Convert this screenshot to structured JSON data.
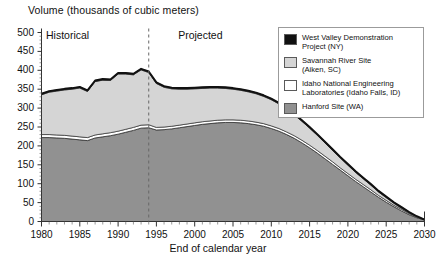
{
  "chart_data": {
    "type": "area",
    "stacked": true,
    "title": "Volume (thousands of cubic meters)",
    "xlabel": "End of calendar year",
    "ylabel": "Volume (thousands of cubic meters)",
    "xlim": [
      1980,
      2030
    ],
    "ylim": [
      0,
      500
    ],
    "yticks": [
      0,
      50,
      100,
      150,
      200,
      250,
      300,
      350,
      400,
      450,
      500
    ],
    "xticks": [
      1980,
      1985,
      1990,
      1995,
      2000,
      2005,
      2010,
      2015,
      2020,
      2025,
      2030
    ],
    "minor_xtick_interval": 1,
    "grid": false,
    "legend_position": "top-right",
    "annotations": [
      {
        "text": "Historical",
        "x": 1984.5,
        "y": 490
      },
      {
        "text": "Projected",
        "x": 2001.5,
        "y": 490
      },
      {
        "text": "divider",
        "type": "vline",
        "x": 1994,
        "style": "dashed"
      }
    ],
    "x": [
      1980,
      1981,
      1982,
      1983,
      1984,
      1985,
      1986,
      1987,
      1988,
      1989,
      1990,
      1991,
      1992,
      1993,
      1994,
      1995,
      1996,
      1997,
      1998,
      1999,
      2000,
      2001,
      2002,
      2003,
      2004,
      2005,
      2006,
      2007,
      2008,
      2009,
      2010,
      2011,
      2012,
      2013,
      2014,
      2015,
      2016,
      2017,
      2018,
      2019,
      2020,
      2021,
      2022,
      2023,
      2024,
      2025,
      2026,
      2027,
      2028,
      2029,
      2030
    ],
    "series": [
      {
        "name": "Hanford Site (WA)",
        "color": "#919191",
        "values": [
          222,
          222,
          221,
          220,
          218,
          216,
          214,
          221,
          224,
          227,
          231,
          236,
          241,
          247,
          248,
          242,
          243,
          245,
          248,
          251,
          254,
          257,
          259,
          261,
          262,
          262,
          261,
          259,
          256,
          252,
          246,
          239,
          230,
          220,
          208,
          195,
          181,
          166,
          151,
          136,
          121,
          106,
          92,
          78,
          64,
          51,
          39,
          28,
          18,
          10,
          4
        ]
      },
      {
        "name": "Idaho National Engineering Laboratories (Idaho Falls, ID)",
        "color": "#ffffff",
        "values": [
          8,
          8,
          8,
          8,
          8,
          8,
          8,
          8,
          8,
          8,
          8,
          8,
          8,
          8,
          8,
          7,
          7,
          7,
          7,
          7,
          7,
          7,
          7,
          7,
          7,
          7,
          7,
          7,
          7,
          7,
          7,
          7,
          7,
          7,
          7,
          7,
          7,
          7,
          7,
          6,
          6,
          6,
          6,
          6,
          5,
          5,
          4,
          4,
          3,
          2,
          1
        ]
      },
      {
        "name": "Savannah River Site (Aiken, SC)",
        "color": "#d5d5d5",
        "values": [
          105,
          112,
          116,
          120,
          124,
          129,
          122,
          141,
          142,
          138,
          151,
          146,
          139,
          146,
          138,
          116,
          105,
          99,
          95,
          92,
          90,
          88,
          87,
          85,
          83,
          81,
          79,
          77,
          75,
          72,
          69,
          65,
          60,
          55,
          50,
          45,
          40,
          35,
          30,
          26,
          22,
          18,
          15,
          12,
          9,
          7,
          5,
          3,
          2,
          1,
          0
        ]
      },
      {
        "name": "West Valley Demonstration Project (NY)",
        "color": "#111111",
        "values": [
          3,
          3,
          3,
          3,
          3,
          3,
          3,
          3,
          3,
          3,
          3,
          3,
          3,
          3,
          3,
          3,
          3,
          3,
          3,
          3,
          3,
          3,
          3,
          3,
          3,
          3,
          3,
          3,
          3,
          3,
          3,
          3,
          3,
          3,
          3,
          3,
          3,
          3,
          3,
          3,
          3,
          3,
          3,
          3,
          3,
          3,
          3,
          3,
          2,
          1,
          0
        ]
      }
    ],
    "totals": [
      338,
      345,
      348,
      351,
      353,
      356,
      347,
      373,
      377,
      376,
      393,
      393,
      391,
      404,
      397,
      368,
      358,
      354,
      353,
      353,
      354,
      355,
      356,
      356,
      355,
      353,
      350,
      346,
      341,
      334,
      325,
      314,
      300,
      285,
      268,
      250,
      231,
      211,
      191,
      171,
      152,
      133,
      116,
      99,
      81,
      66,
      51,
      38,
      25,
      14,
      5
    ]
  },
  "legend": {
    "items": [
      {
        "label_line1": "West Valley Demonstration",
        "label_line2": "Project (NY)",
        "color": "#111111"
      },
      {
        "label_line1": "Savannah River Site",
        "label_line2": "(Aiken, SC)",
        "color": "#d5d5d5"
      },
      {
        "label_line1": "Idaho National Engineering",
        "label_line2": "Laboratories (Idaho Falls, ID)",
        "color": "#ffffff"
      },
      {
        "label_line1": "Hanford Site (WA)",
        "label_line2": "",
        "color": "#919191"
      }
    ]
  }
}
